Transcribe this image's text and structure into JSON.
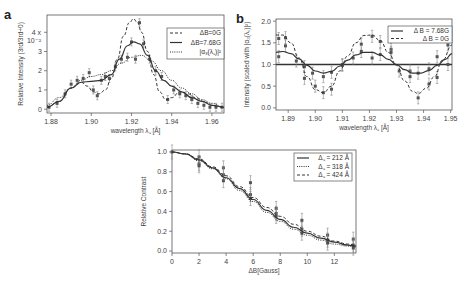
{
  "chart_data": [
    {
      "panel": "a",
      "type": "line",
      "title": "",
      "xlabel": "wavelength λ꜀ [Å]",
      "ylabel": "Relative Intensity (3rd/3rd+0)",
      "y_multiplier": "x 10⁻²",
      "xlim": [
        1.878,
        1.966
      ],
      "ylim": [
        -0.2,
        4.9
      ],
      "xticks": [
        "1.88",
        "1.90",
        "1.92",
        "1.94",
        "1.96"
      ],
      "yticks": [
        "0",
        "1",
        "2",
        "3",
        "4"
      ],
      "legend": [
        "ΔB=0G",
        "ΔB=7.68G",
        "|α₃(λ꜀)|²"
      ],
      "series": [
        {
          "name": "ΔB=0G",
          "style": "dashed",
          "x": [
            1.878,
            1.884,
            1.89,
            1.895,
            1.898,
            1.901,
            1.904,
            1.907,
            1.91,
            1.913,
            1.916,
            1.919,
            1.921,
            1.923,
            1.925,
            1.928,
            1.931,
            1.934,
            1.937,
            1.94,
            1.944,
            1.948,
            1.952,
            1.956,
            1.96,
            1.966
          ],
          "y": [
            0.1,
            0.4,
            1.1,
            1.4,
            1.2,
            0.9,
            0.8,
            1.0,
            1.6,
            2.6,
            3.8,
            4.5,
            4.7,
            4.5,
            4.0,
            3.0,
            1.8,
            0.9,
            0.5,
            0.6,
            0.9,
            0.8,
            0.6,
            0.4,
            0.2,
            0.1
          ]
        },
        {
          "name": "ΔB=7.68G",
          "style": "solid",
          "x": [
            1.878,
            1.884,
            1.89,
            1.895,
            1.9,
            1.905,
            1.91,
            1.914,
            1.918,
            1.921,
            1.924,
            1.928,
            1.932,
            1.936,
            1.94,
            1.945,
            1.95,
            1.955,
            1.96,
            1.966
          ],
          "y": [
            0.1,
            0.4,
            1.1,
            1.4,
            1.45,
            1.5,
            1.8,
            2.6,
            3.3,
            3.5,
            3.4,
            2.8,
            2.0,
            1.5,
            1.2,
            0.9,
            0.6,
            0.4,
            0.2,
            0.1
          ]
        },
        {
          "name": "|α₃(λ꜀)|²",
          "style": "dotted",
          "x": [
            1.878,
            1.884,
            1.89,
            1.895,
            1.9,
            1.905,
            1.91,
            1.915,
            1.92,
            1.925,
            1.93,
            1.935,
            1.94,
            1.945,
            1.95,
            1.955,
            1.96,
            1.966
          ],
          "y": [
            0.2,
            0.6,
            1.1,
            1.5,
            1.7,
            1.8,
            2.0,
            2.4,
            2.7,
            2.8,
            2.5,
            2.0,
            1.5,
            1.1,
            0.8,
            0.5,
            0.3,
            0.1
          ]
        }
      ],
      "points": {
        "x": [
          1.879,
          1.883,
          1.887,
          1.89,
          1.893,
          1.896,
          1.899,
          1.901,
          1.903,
          1.905,
          1.907,
          1.909,
          1.912,
          1.915,
          1.918,
          1.92,
          1.922,
          1.924,
          1.926,
          1.929,
          1.932,
          1.935,
          1.938,
          1.941,
          1.944,
          1.947,
          1.95,
          1.953,
          1.956,
          1.959,
          1.962,
          1.965
        ],
        "y": [
          0.1,
          0.3,
          0.8,
          1.3,
          1.5,
          1.6,
          1.9,
          1.0,
          0.7,
          1.5,
          1.7,
          1.6,
          2.2,
          2.6,
          2.7,
          3.5,
          2.6,
          4.5,
          3.4,
          2.6,
          2.0,
          1.7,
          0.5,
          1.0,
          0.8,
          0.7,
          0.5,
          0.3,
          0.2,
          0.1,
          0.1,
          0.1
        ]
      }
    },
    {
      "panel": "b",
      "type": "line",
      "title": "",
      "xlabel": "wavelength λ꜀ [Å]",
      "ylabel": "Intensity (scaled with |α₃(λ꜀)|²)",
      "xlim": [
        1.8855,
        1.9505
      ],
      "ylim": [
        -0.05,
        2.05
      ],
      "xticks": [
        "1.89",
        "1.90",
        "1.91",
        "1.92",
        "1.93",
        "1.94",
        "1.95"
      ],
      "yticks": [
        "0.0",
        "0.5",
        "1.0",
        "1.5",
        "2.0"
      ],
      "legend": [
        "Δ B = 7.68G",
        "Δ B = 0G"
      ],
      "reference_line": 1.0,
      "series": [
        {
          "name": "Δ B = 7.68G",
          "style": "solid",
          "x": [
            1.8855,
            1.888,
            1.891,
            1.894,
            1.897,
            1.9,
            1.903,
            1.906,
            1.909,
            1.912,
            1.915,
            1.918,
            1.921,
            1.924,
            1.927,
            1.93,
            1.933,
            1.936,
            1.939,
            1.942,
            1.945,
            1.948,
            1.9505
          ],
          "y": [
            1.28,
            1.3,
            1.25,
            1.13,
            0.98,
            0.85,
            0.8,
            0.84,
            0.96,
            1.1,
            1.22,
            1.28,
            1.28,
            1.22,
            1.12,
            1.0,
            0.88,
            0.8,
            0.8,
            0.86,
            0.98,
            1.12,
            1.25
          ]
        },
        {
          "name": "Δ B = 0G",
          "style": "dashed",
          "x": [
            1.8855,
            1.888,
            1.891,
            1.894,
            1.897,
            1.9,
            1.903,
            1.906,
            1.909,
            1.912,
            1.915,
            1.918,
            1.921,
            1.924,
            1.927,
            1.93,
            1.933,
            1.936,
            1.938,
            1.941,
            1.944,
            1.947,
            1.9505
          ],
          "y": [
            1.68,
            1.68,
            1.5,
            1.15,
            0.72,
            0.42,
            0.35,
            0.5,
            0.85,
            1.2,
            1.5,
            1.67,
            1.68,
            1.55,
            1.28,
            0.98,
            0.62,
            0.38,
            0.33,
            0.45,
            0.72,
            1.1,
            1.45
          ]
        }
      ],
      "points": {
        "x": [
          1.8865,
          1.8865,
          1.889,
          1.889,
          1.893,
          1.896,
          1.896,
          1.899,
          1.9,
          1.903,
          1.903,
          1.906,
          1.906,
          1.91,
          1.91,
          1.914,
          1.917,
          1.917,
          1.921,
          1.921,
          1.924,
          1.924,
          1.928,
          1.928,
          1.931,
          1.935,
          1.935,
          1.938,
          1.938,
          1.942,
          1.942,
          1.945,
          1.945,
          1.949,
          1.949
        ],
        "y": [
          1.6,
          1.18,
          1.62,
          1.43,
          1.08,
          0.95,
          0.68,
          0.8,
          0.5,
          0.72,
          0.35,
          0.82,
          0.43,
          0.98,
          1.0,
          1.15,
          1.47,
          1.3,
          1.65,
          1.15,
          1.53,
          1.23,
          1.35,
          1.28,
          0.85,
          0.85,
          0.72,
          0.8,
          0.23,
          0.9,
          0.55,
          1.18,
          0.7,
          1.45,
          1.0
        ]
      }
    },
    {
      "panel": "c",
      "type": "line",
      "title": "",
      "xlabel": "ΔB[Gauss]",
      "ylabel": "Relative Contrast",
      "xlim": [
        0,
        13.6
      ],
      "ylim": [
        -0.02,
        1.02
      ],
      "xticks": [
        "0",
        "2",
        "4",
        "6",
        "8",
        "10",
        "12"
      ],
      "yticks": [
        "0.0",
        "0.2",
        "0.4",
        "0.6",
        "0.8",
        "1.0"
      ],
      "legend": [
        "Δ꜀ = 212 Å",
        "Δ꜀ = 318 Å",
        "Δ꜀ = 424 Å"
      ],
      "series": [
        {
          "name": "Δ꜀ = 212 Å",
          "style": "solid",
          "x": [
            0,
            1,
            2,
            3,
            4,
            5,
            6,
            7,
            8,
            9,
            10,
            11,
            12,
            13,
            13.6
          ],
          "y": [
            1.0,
            0.98,
            0.92,
            0.84,
            0.74,
            0.63,
            0.52,
            0.41,
            0.32,
            0.24,
            0.18,
            0.13,
            0.09,
            0.06,
            0.05
          ]
        },
        {
          "name": "Δ꜀ = 318 Å",
          "style": "dotted",
          "x": [
            0,
            1,
            2,
            3,
            4,
            5,
            6,
            7,
            8,
            9,
            10,
            11,
            12,
            13,
            13.6
          ],
          "y": [
            1.0,
            0.98,
            0.91,
            0.83,
            0.73,
            0.61,
            0.5,
            0.39,
            0.3,
            0.22,
            0.16,
            0.11,
            0.07,
            0.05,
            0.04
          ]
        },
        {
          "name": "Δ꜀ = 424 Å",
          "style": "dashed",
          "x": [
            0,
            1,
            2,
            3,
            4,
            5,
            6,
            7,
            8,
            9,
            10,
            11,
            12,
            13,
            13.6
          ],
          "y": [
            1.0,
            0.98,
            0.93,
            0.85,
            0.76,
            0.65,
            0.54,
            0.44,
            0.35,
            0.27,
            0.2,
            0.15,
            0.1,
            0.07,
            0.06
          ]
        }
      ],
      "points": {
        "x": [
          0,
          2,
          2,
          2,
          3.8,
          3.8,
          3.8,
          5.8,
          5.8,
          5.8,
          7.7,
          7.7,
          7.7,
          9.6,
          9.6,
          9.6,
          11.5,
          11.5,
          11.5,
          13.4,
          13.4,
          13.4
        ],
        "y": [
          1.0,
          0.95,
          0.88,
          0.86,
          0.84,
          0.77,
          0.71,
          0.69,
          0.57,
          0.53,
          0.43,
          0.38,
          0.35,
          0.31,
          0.22,
          0.18,
          0.16,
          0.11,
          0.08,
          0.12,
          0.06,
          0.03
        ]
      }
    }
  ],
  "labels": {
    "panel_a": "a",
    "panel_b": "b",
    "a_ylabel": "Relative Intensity (3rd/3rd+0)",
    "a_multiplier_top": "4 x",
    "a_multiplier_bottom": "10⁻²",
    "a_xlabel": "wavelength λ꜀ [Å]",
    "b_ylabel": "Intensity (scaled with |α₃(λ꜀)|²)",
    "b_xlabel": "wavelength λ꜀ [Å]",
    "c_ylabel": "Relative Contrast",
    "c_xlabel": "ΔB[Gauss]"
  }
}
